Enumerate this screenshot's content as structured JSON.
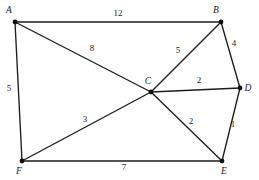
{
  "figure": {
    "kind": "weighted-undirected-graph",
    "background_color": "#ffffff",
    "line_color": "#1c1c1c",
    "node_color": "#111111",
    "text_color": "#1a1a1a",
    "width": 259,
    "height": 180
  },
  "nodes": [
    {
      "id": "A",
      "label": "A",
      "x": 15,
      "y": 22,
      "label_x": 9,
      "label_y": 13,
      "anchor": "middle"
    },
    {
      "id": "B",
      "label": "B",
      "x": 221,
      "y": 22,
      "label_x": 216,
      "label_y": 13,
      "anchor": "middle"
    },
    {
      "id": "C",
      "label": "C",
      "x": 151,
      "y": 92,
      "label_x": 148,
      "label_y": 84,
      "anchor": "middle"
    },
    {
      "id": "D",
      "label": "D",
      "x": 240,
      "y": 88,
      "label_x": 248,
      "label_y": 91,
      "anchor": "middle"
    },
    {
      "id": "E",
      "label": "E",
      "x": 222,
      "y": 161,
      "label_x": 224,
      "label_y": 174,
      "anchor": "middle"
    },
    {
      "id": "F",
      "label": "F",
      "x": 22,
      "y": 161,
      "label_x": 19,
      "label_y": 174,
      "anchor": "middle"
    }
  ],
  "edges": [
    {
      "id": "AB",
      "from": "A",
      "to": "B",
      "weight": "12",
      "label_x": 118,
      "label_y": 16
    },
    {
      "id": "AC",
      "from": "A",
      "to": "C",
      "weight": "8",
      "label_x": 92,
      "label_y": 51
    },
    {
      "id": "AF",
      "from": "A",
      "to": "F",
      "weight": "5",
      "label_x": 9,
      "label_y": 91
    },
    {
      "id": "BC",
      "from": "B",
      "to": "C",
      "weight": "5",
      "label_x": 178,
      "label_y": 53
    },
    {
      "id": "BD",
      "from": "B",
      "to": "D",
      "weight": "4",
      "label_x": 234,
      "label_y": 46
    },
    {
      "id": "CD",
      "from": "C",
      "to": "D",
      "weight": "2",
      "label_x": 199,
      "label_y": 83
    },
    {
      "id": "CE",
      "from": "C",
      "to": "E",
      "weight": "2",
      "label_x": 191,
      "label_y": 124
    },
    {
      "id": "CF",
      "from": "C",
      "to": "F",
      "weight": "3",
      "label_x": 85,
      "label_y": 122
    },
    {
      "id": "DE",
      "from": "D",
      "to": "E",
      "weight": "1",
      "label_x": 233,
      "label_y": 127
    },
    {
      "id": "FE",
      "from": "F",
      "to": "E",
      "weight": "7",
      "label_x": 124,
      "label_y": 170
    }
  ]
}
